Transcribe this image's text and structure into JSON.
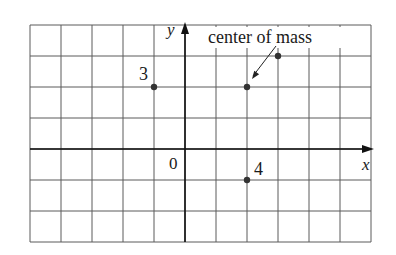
{
  "diagram": {
    "grid": {
      "x_min_units": -5,
      "x_max_units": 6,
      "y_min_units": -3,
      "y_max_units": 4,
      "cell_px": 31,
      "origin_px": [
        185,
        149
      ],
      "line_color": "#5a5a5a"
    },
    "axes": {
      "x_label": "x",
      "y_label": "y",
      "origin_label": "0",
      "color": "#111111"
    },
    "masses": [
      {
        "label": "3",
        "x": -1,
        "y": 2
      },
      {
        "label": "8",
        "x": 3,
        "y": 3
      },
      {
        "label": "4",
        "x": 2,
        "y": -1
      }
    ],
    "center_of_mass": {
      "label": "center of mass",
      "x": 2,
      "y": 2
    },
    "point_color": "#333333"
  }
}
